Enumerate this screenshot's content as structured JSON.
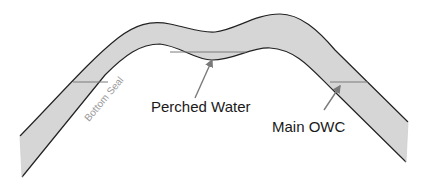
{
  "diagram": {
    "type": "anticline cross-section",
    "colors": {
      "reservoir_fill": "#d6d6d6",
      "outline": "#222222",
      "contact_line": "#7a7a7a",
      "arrow": "#7a7a7a",
      "label_text": "#1a1a1a",
      "seal_text": "#9a9a9a",
      "background": "#ffffff"
    },
    "labels": {
      "bottom_seal": "Bottom Seal",
      "perched_water": "Perched Water",
      "main_owc": "Main OWC"
    }
  }
}
